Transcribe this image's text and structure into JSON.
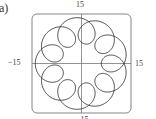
{
  "figure": {
    "part_label": "(a)"
  },
  "chart_data": {
    "type": "line",
    "subtype": "parametric-curve",
    "title": "",
    "xlabel": "",
    "ylabel": "",
    "xlim": [
      -15,
      15
    ],
    "ylim": [
      -15,
      15
    ],
    "grid": false,
    "axes_visible": true,
    "frame": "rounded-box",
    "tick_labels": {
      "top": "15",
      "left": "−15",
      "right": "15",
      "bottom": "−15"
    },
    "series": [
      {
        "name": "curve",
        "equation": {
          "x": "10 cos t − 4 cos(10t)",
          "y": "10 sin t − 4 sin(10t)"
        },
        "parameter_range": [
          0,
          6.283185307
        ],
        "loops": 9,
        "max_radius": 14,
        "color": "#333333"
      }
    ]
  }
}
